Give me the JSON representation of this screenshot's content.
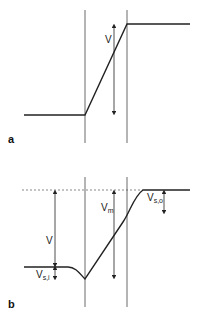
{
  "figure": {
    "panels": [
      {
        "id": "a",
        "label": "a",
        "annotations": [
          {
            "name": "V",
            "text": "V"
          }
        ]
      },
      {
        "id": "b",
        "label": "b",
        "annotations": [
          {
            "name": "V",
            "text": "V"
          },
          {
            "name": "Vm",
            "text": "V",
            "sub": "m"
          },
          {
            "name": "Vsi",
            "text": "V",
            "sub": "s,i"
          },
          {
            "name": "Vso",
            "text": "V",
            "sub": "s,o"
          }
        ]
      }
    ],
    "colors": {
      "line": "#222222",
      "dashed": "#555555",
      "background": "#ffffff"
    }
  }
}
